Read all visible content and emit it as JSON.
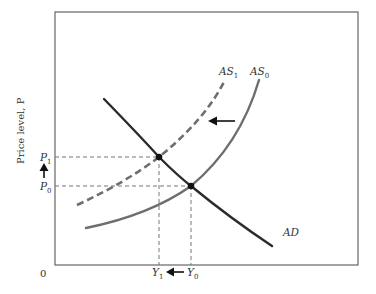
{
  "diagram": {
    "type": "AD-AS shift (supply shock, leftward shift of aggregate supply)",
    "frame": {
      "x": 55,
      "y": 12,
      "width": 303,
      "height": 253
    },
    "origin_label": "0",
    "y_axis_label": "Price level, P",
    "price_labels": {
      "p1": {
        "base": "P",
        "sub": "1",
        "y": 157
      },
      "p0": {
        "base": "P",
        "sub": "0",
        "y": 186
      }
    },
    "output_labels": {
      "y1": {
        "base": "Y",
        "sub": "1",
        "x": 159
      },
      "y0": {
        "base": "Y",
        "sub": "0",
        "x": 191
      }
    },
    "curves": {
      "ad": {
        "label": "AD",
        "style": "solid",
        "color": "#2b2b2b"
      },
      "as0": {
        "label_base": "AS",
        "label_sub": "0",
        "style": "solid",
        "color": "#6e6e6e"
      },
      "as1": {
        "label_base": "AS",
        "label_sub": "1",
        "style": "dashed",
        "color": "#6e6e6e"
      }
    },
    "equilibria": [
      {
        "name": "initial",
        "x": 191,
        "y": 186,
        "price": "P0",
        "output": "Y0"
      },
      {
        "name": "new",
        "x": 159,
        "y": 157,
        "price": "P1",
        "output": "Y1"
      }
    ],
    "arrows": {
      "shift": {
        "direction": "left",
        "meaning": "AS shifts left from AS0 to AS1"
      },
      "price": {
        "direction": "up",
        "meaning": "price level rises from P0 to P1"
      },
      "output": {
        "direction": "left",
        "meaning": "output falls from Y0 to Y1"
      }
    },
    "colors": {
      "axis": "#666666",
      "guide": "#777777",
      "point": "#111111"
    }
  }
}
